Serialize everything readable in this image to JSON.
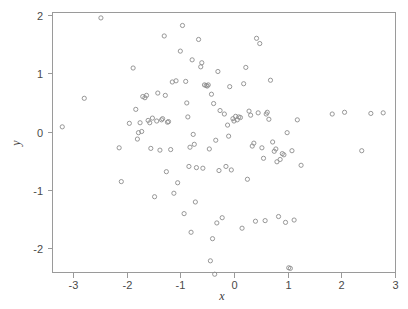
{
  "figure": {
    "background_color": "#ffffff",
    "frame_color": "#9a9a9a",
    "marker_color": "#8c8c8c",
    "text_color": "#4a4a4a"
  },
  "axis": {
    "x_title": "x",
    "y_title": "y",
    "x_ticks": [
      "-3",
      "-2",
      "-1",
      "0",
      "1",
      "2",
      "3"
    ],
    "y_ticks": [
      "2",
      "1",
      "0",
      "-1",
      "-2"
    ]
  },
  "chart_data": {
    "type": "scatter",
    "title": "",
    "xlabel": "x",
    "ylabel": "y",
    "xlim": [
      -3.4,
      3.0
    ],
    "ylim": [
      -2.55,
      2.1
    ],
    "xticks": [
      -3,
      -2,
      -1,
      0,
      1,
      2,
      3
    ],
    "yticks": [
      -2,
      -1,
      0,
      1,
      2
    ],
    "grid": false,
    "legend": null,
    "marker": "open-circle",
    "n_points": 120,
    "series": [
      {
        "name": "points",
        "x": [
          -3.2,
          -2.79,
          -2.48,
          -2.14,
          -2.1,
          -1.95,
          -1.88,
          -1.83,
          -1.8,
          -1.78,
          -1.75,
          -1.72,
          -1.7,
          -1.66,
          -1.63,
          -1.6,
          -1.57,
          -1.55,
          -1.52,
          -1.48,
          -1.44,
          -1.42,
          -1.38,
          -1.35,
          -1.33,
          -1.3,
          -1.28,
          -1.26,
          -1.24,
          -1.22,
          -1.18,
          -1.15,
          -1.12,
          -1.08,
          -1.05,
          -1.0,
          -0.96,
          -0.93,
          -0.9,
          -0.88,
          -0.86,
          -0.84,
          -0.82,
          -0.8,
          -0.78,
          -0.76,
          -0.74,
          -0.72,
          -0.7,
          -0.66,
          -0.62,
          -0.6,
          -0.58,
          -0.55,
          -0.52,
          -0.5,
          -0.48,
          -0.46,
          -0.44,
          -0.42,
          -0.4,
          -0.38,
          -0.36,
          -0.34,
          -0.32,
          -0.3,
          -0.28,
          -0.26,
          -0.22,
          -0.18,
          -0.15,
          -0.12,
          -0.1,
          -0.08,
          -0.05,
          -0.02,
          0.0,
          0.03,
          0.06,
          0.09,
          0.12,
          0.15,
          0.18,
          0.22,
          0.25,
          0.28,
          0.31,
          0.34,
          0.37,
          0.4,
          0.42,
          0.45,
          0.48,
          0.52,
          0.55,
          0.58,
          0.6,
          0.62,
          0.65,
          0.68,
          0.72,
          0.75,
          0.78,
          0.8,
          0.83,
          0.86,
          0.9,
          0.93,
          0.96,
          0.99,
          1.02,
          1.05,
          1.08,
          1.12,
          1.18,
          1.25,
          1.83,
          2.06,
          2.38,
          2.55,
          2.78
        ],
        "y": [
          0.08,
          0.57,
          1.95,
          -0.28,
          -0.86,
          0.14,
          1.09,
          0.38,
          -0.13,
          -0.02,
          0.15,
          0.0,
          0.6,
          0.58,
          0.62,
          0.19,
          0.15,
          -0.29,
          0.23,
          -1.12,
          0.18,
          0.66,
          -0.32,
          0.2,
          0.22,
          1.64,
          0.62,
          -0.69,
          0.16,
          0.17,
          -0.31,
          0.85,
          -1.06,
          0.87,
          -0.88,
          1.38,
          1.82,
          -1.41,
          0.86,
          0.49,
          0.25,
          -0.6,
          -0.27,
          -1.73,
          1.23,
          -0.05,
          -0.22,
          -1.21,
          -0.62,
          1.58,
          1.11,
          1.18,
          -0.63,
          0.8,
          0.79,
          0.78,
          0.8,
          -0.3,
          -2.22,
          0.64,
          -1.84,
          0.48,
          -2.45,
          -0.15,
          -1.57,
          1.03,
          -0.67,
          0.36,
          -1.48,
          0.3,
          -0.6,
          0.11,
          -0.08,
          0.77,
          -0.66,
          0.22,
          0.18,
          0.26,
          0.2,
          0.25,
          0.24,
          -1.66,
          0.82,
          1.1,
          -0.82,
          0.35,
          0.28,
          -0.25,
          -0.2,
          -1.54,
          1.6,
          0.32,
          1.51,
          -0.28,
          -0.46,
          -1.53,
          0.3,
          0.33,
          0.21,
          0.88,
          -0.18,
          -0.34,
          -0.3,
          -0.52,
          -1.46,
          -0.48,
          -0.38,
          -0.4,
          -1.56,
          -0.02,
          -2.34,
          -2.35,
          -0.33,
          -1.52,
          0.2,
          -0.58,
          0.3,
          0.33,
          -0.33,
          0.31,
          0.32
        ]
      }
    ]
  }
}
